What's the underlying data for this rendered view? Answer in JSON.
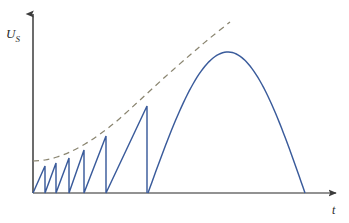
{
  "figure": {
    "background_color": "#ffffff"
  },
  "axes": {
    "y_label": "U",
    "y_label_subscript": "S",
    "x_label": "t",
    "axis_color": "#3b3b3b",
    "origin_px": [
      33,
      193
    ],
    "y_axis_top_px": [
      33,
      10
    ],
    "x_axis_right_px": [
      340,
      193
    ]
  },
  "chart_data": {
    "type": "line",
    "title": "",
    "xlabel": "t",
    "ylabel": "U_S",
    "grid": false,
    "legend": "none",
    "xlim": [
      0,
      340
    ],
    "ylim": [
      0,
      193
    ],
    "series": [
      {
        "name": "sawtooth-waveform",
        "color": "#3a5b9b",
        "style": "solid",
        "description": "Rising sawtooth ramps of increasing amplitude and period, each dropping vertically to zero",
        "teeth": [
          {
            "start_x": 33,
            "peak_x": 45,
            "peak_y": 166
          },
          {
            "start_x": 45,
            "peak_x": 56,
            "peak_y": 163
          },
          {
            "start_x": 56,
            "peak_x": 69,
            "peak_y": 158
          },
          {
            "start_x": 69,
            "peak_x": 84,
            "peak_y": 150
          },
          {
            "start_x": 84,
            "peak_x": 106,
            "peak_y": 136
          },
          {
            "start_x": 106,
            "peak_x": 147,
            "peak_y": 106
          },
          {
            "start_x": 147,
            "peak_x": 147,
            "peak_y": 106
          }
        ],
        "baseline_y": 193
      },
      {
        "name": "envelope-curve",
        "color": "#8a8570",
        "style": "dashed",
        "description": "Dashed exponential-like envelope tangent to the sawtooth peaks",
        "points": [
          [
            33,
            161
          ],
          [
            45,
            160
          ],
          [
            57,
            157
          ],
          [
            70,
            152
          ],
          [
            85,
            144
          ],
          [
            100,
            134
          ],
          [
            118,
            120
          ],
          [
            140,
            100
          ],
          [
            165,
            77
          ],
          [
            190,
            55
          ],
          [
            210,
            38
          ],
          [
            230,
            22
          ]
        ]
      },
      {
        "name": "sine-hump",
        "color": "#3a5b9b",
        "style": "solid",
        "description": "Large half-sine arch rising from the final sawtooth reset and returning to the baseline",
        "start_x": 148,
        "peak": [
          228,
          52
        ],
        "end_x": 305,
        "baseline_y": 193
      }
    ]
  },
  "colors": {
    "curve_blue": "#3a5b9b",
    "dash_olive": "#8a8570",
    "axis_gray": "#3b3b3b",
    "background": "#ffffff"
  }
}
